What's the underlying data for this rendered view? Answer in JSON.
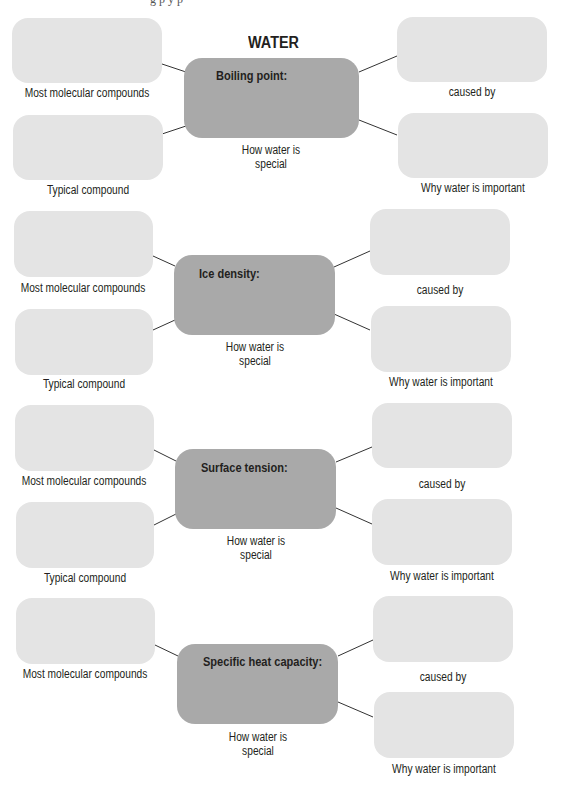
{
  "title": "WATER",
  "header_fragment": "g   p   y   p",
  "sections": [
    {
      "property": "Boiling point:",
      "left_top_label": "Most molecular compounds",
      "left_bottom_label": "Typical compound",
      "center_label_line1": "How water is",
      "center_label_line2": "special",
      "right_top_label": "caused by",
      "right_bottom_label": "Why water is important"
    },
    {
      "property": "Ice density:",
      "left_top_label": "Most molecular compounds",
      "left_bottom_label": "Typical compound",
      "center_label_line1": "How water is",
      "center_label_line2": "special",
      "right_top_label": "caused by",
      "right_bottom_label": "Why water is important"
    },
    {
      "property": "Surface tension:",
      "left_top_label": "Most molecular compounds",
      "left_bottom_label": "Typical compound",
      "center_label_line1": "How water is",
      "center_label_line2": "special",
      "right_top_label": "caused by",
      "right_bottom_label": "Why water is important"
    },
    {
      "property": "Specific heat capacity:",
      "left_top_label": "Most molecular compounds",
      "center_label_line1": "How water is",
      "center_label_line2": "special",
      "right_top_label": "caused by",
      "right_bottom_label": "Why water is important"
    }
  ],
  "colors": {
    "answer_box": "#e4e4e4",
    "center_box": "#a9a9a9",
    "connector": "#333333",
    "text": "#231f20"
  }
}
